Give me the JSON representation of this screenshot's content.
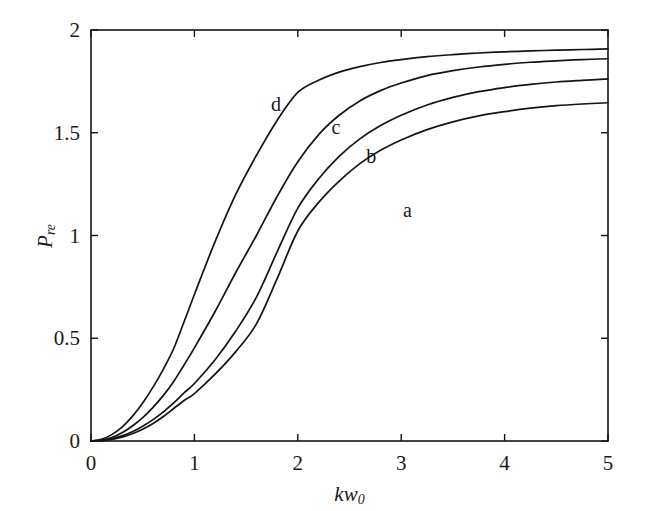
{
  "chart_data": {
    "type": "line",
    "title": "",
    "xlabel": "kw_0",
    "ylabel": "P_re",
    "xlabel_parts": {
      "base1": "k",
      "base2": "w",
      "sub": "0"
    },
    "ylabel_parts": {
      "base": "P",
      "sub": "re"
    },
    "xlim": [
      0,
      5
    ],
    "ylim": [
      0,
      2
    ],
    "xticks": [
      "0",
      "1",
      "2",
      "3",
      "4",
      "5"
    ],
    "xtick_values": [
      0,
      1,
      2,
      3,
      4,
      5
    ],
    "yticks": [
      "0",
      "0.5",
      "1",
      "1.5",
      "2"
    ],
    "ytick_values": [
      0,
      0.5,
      1,
      1.5,
      2
    ],
    "grid": false,
    "legend": "inline-curve-labels",
    "line_color": "#141414",
    "frame_color": "#141414",
    "x": [
      0,
      0.1,
      0.2,
      0.3,
      0.4,
      0.5,
      0.6,
      0.7,
      0.8,
      0.9,
      1.0,
      1.2,
      1.4,
      1.6,
      1.8,
      2.0,
      2.2,
      2.4,
      2.6,
      2.8,
      3.0,
      3.25,
      3.5,
      3.75,
      4.0,
      4.25,
      4.5,
      4.75,
      5.0
    ],
    "series": [
      {
        "name": "a",
        "label": "a",
        "label_x": 3.06,
        "label_y": 1.125,
        "values": [
          0.0,
          0.002,
          0.008,
          0.019,
          0.035,
          0.057,
          0.085,
          0.119,
          0.158,
          0.197,
          0.231,
          0.325,
          0.435,
          0.57,
          0.79,
          1.022,
          1.16,
          1.265,
          1.35,
          1.415,
          1.465,
          1.515,
          1.553,
          1.582,
          1.603,
          1.62,
          1.632,
          1.64,
          1.646
        ]
      },
      {
        "name": "b",
        "label": "b",
        "label_x": 2.71,
        "label_y": 1.385,
        "values": [
          0.0,
          0.003,
          0.011,
          0.025,
          0.045,
          0.072,
          0.104,
          0.142,
          0.185,
          0.234,
          0.28,
          0.395,
          0.535,
          0.7,
          0.92,
          1.133,
          1.275,
          1.385,
          1.47,
          1.535,
          1.585,
          1.635,
          1.672,
          1.7,
          1.72,
          1.735,
          1.747,
          1.755,
          1.762
        ]
      },
      {
        "name": "c",
        "label": "c",
        "label_x": 2.37,
        "label_y": 1.53,
        "values": [
          0.0,
          0.004,
          0.017,
          0.04,
          0.073,
          0.114,
          0.164,
          0.222,
          0.29,
          0.37,
          0.453,
          0.63,
          0.82,
          1.0,
          1.19,
          1.359,
          1.49,
          1.585,
          1.655,
          1.705,
          1.742,
          1.778,
          1.802,
          1.82,
          1.833,
          1.843,
          1.85,
          1.856,
          1.86
        ]
      },
      {
        "name": "d",
        "label": "d",
        "label_x": 1.79,
        "label_y": 1.64,
        "values": [
          0.0,
          0.008,
          0.031,
          0.068,
          0.12,
          0.185,
          0.262,
          0.35,
          0.45,
          0.58,
          0.713,
          0.97,
          1.2,
          1.39,
          1.56,
          1.696,
          1.755,
          1.795,
          1.822,
          1.842,
          1.856,
          1.87,
          1.88,
          1.888,
          1.894,
          1.898,
          1.902,
          1.905,
          1.908
        ]
      }
    ]
  },
  "layout": {
    "plot_left_px": 91,
    "plot_right_px": 608,
    "plot_top_px": 30,
    "plot_bottom_px": 441
  }
}
